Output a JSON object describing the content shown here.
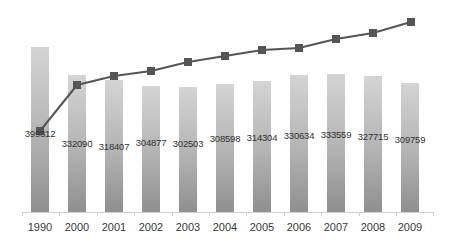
{
  "chart_data": {
    "type": "bar",
    "title": "",
    "xlabel": "",
    "ylabel": "",
    "categories": [
      "1990",
      "2000",
      "2001",
      "2002",
      "2003",
      "2004",
      "2005",
      "2006",
      "2007",
      "2008",
      "2009"
    ],
    "series": [
      {
        "name": "Bar series",
        "type": "bar",
        "values": [
          399312,
          332090,
          318407,
          304877,
          302503,
          308598,
          314304,
          330634,
          333559,
          327715,
          309759
        ],
        "data_labels": [
          "399312",
          "332090",
          "318407",
          "304877",
          "302503",
          "308598",
          "314304",
          "330634",
          "333559",
          "327715",
          "309759"
        ]
      },
      {
        "name": "Line series",
        "type": "line",
        "marker": "square",
        "values_relative_estimate": [
          0,
          0.42,
          0.5,
          0.55,
          0.63,
          0.69,
          0.74,
          0.76,
          0.84,
          0.89,
          1.0
        ],
        "note": "unlabeled secondary series; values estimated as relative positions"
      }
    ],
    "grid": false,
    "legend": "none",
    "colors": {
      "bar_top": "#d4d4d4",
      "bar_bottom": "#8f8f8f",
      "line": "#555555",
      "marker": "#555555",
      "axis": "#cfcfcf"
    }
  },
  "layout": {
    "baseline_y": 212,
    "bar_x": [
      31,
      68,
      105,
      142,
      179,
      216,
      253,
      290,
      327,
      364,
      401
    ],
    "bar_top_y": [
      47,
      75,
      80,
      86,
      87,
      84,
      81,
      75,
      74,
      76,
      83
    ],
    "label_y": [
      128,
      138,
      141,
      137,
      138,
      133,
      132,
      130,
      129,
      131,
      134
    ],
    "line_points": [
      [
        40,
        131
      ],
      [
        77,
        85
      ],
      [
        114,
        76
      ],
      [
        151,
        71
      ],
      [
        188,
        62
      ],
      [
        225,
        56
      ],
      [
        262,
        50
      ],
      [
        299,
        48
      ],
      [
        336,
        39
      ],
      [
        373,
        33
      ],
      [
        411,
        22
      ]
    ]
  }
}
